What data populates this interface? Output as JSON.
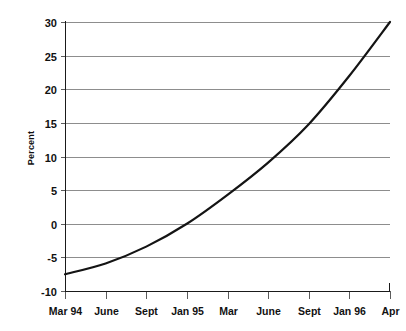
{
  "chart_data": {
    "type": "line",
    "title": "",
    "xlabel": "",
    "ylabel": "Percent",
    "ylim": [
      -10,
      30
    ],
    "yticks": [
      30,
      25,
      20,
      15,
      10,
      5,
      0,
      -5,
      -10
    ],
    "ytick_labels": [
      "30",
      "25",
      "20",
      "15",
      "10",
      "5",
      "0",
      "-5",
      "-10"
    ],
    "grid": true,
    "legend": "none",
    "categories": [
      "Mar 94",
      "June",
      "Sept",
      "Jan 95",
      "Mar",
      "June",
      "Sept",
      "Jan 96",
      "Apr"
    ],
    "x": [
      0,
      1,
      2,
      3,
      4,
      5,
      6,
      7,
      8
    ],
    "values": [
      -7.5,
      -5.9,
      -3.4,
      0.0,
      4.3,
      9.1,
      14.8,
      22.0,
      30.0
    ],
    "series": [
      {
        "name": "Percent",
        "color": "#141414",
        "values": [
          -7.5,
          -5.9,
          -3.4,
          0.0,
          4.3,
          9.1,
          14.8,
          22.0,
          30.0
        ]
      }
    ],
    "line_color": "#141414",
    "grid_color": "#8d8d8d",
    "axis_color": "#1a1a1a",
    "background": "#ffffff"
  }
}
